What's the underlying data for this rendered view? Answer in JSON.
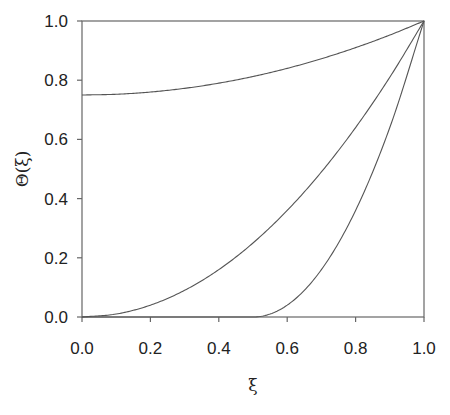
{
  "chart_data": {
    "type": "line",
    "title": "",
    "xlabel": "ξ",
    "ylabel": "Θ(ξ)",
    "xlim": [
      0.0,
      1.0
    ],
    "ylim": [
      0.0,
      1.0
    ],
    "grid": false,
    "legend": null,
    "x_ticks": [
      "0.0",
      "0.2",
      "0.4",
      "0.6",
      "0.8",
      "1.0"
    ],
    "y_ticks": [
      "0.0",
      "0.2",
      "0.4",
      "0.6",
      "0.8",
      "1.0"
    ],
    "x": [
      0.0,
      0.1,
      0.2,
      0.3,
      0.4,
      0.5,
      0.6,
      0.7,
      0.8,
      0.9,
      1.0
    ],
    "series": [
      {
        "name": "curve-1",
        "values": [
          0.75,
          0.7525,
          0.76,
          0.7725,
          0.79,
          0.8125,
          0.84,
          0.8725,
          0.91,
          0.9525,
          1.0
        ]
      },
      {
        "name": "curve-2",
        "values": [
          0.0,
          0.01,
          0.04,
          0.09,
          0.16,
          0.25,
          0.36,
          0.49,
          0.64,
          0.81,
          1.0
        ]
      },
      {
        "name": "curve-3",
        "values": [
          0.0,
          0.0,
          0.0,
          0.0,
          0.0,
          0.0,
          0.04,
          0.16,
          0.36,
          0.64,
          1.0
        ]
      }
    ],
    "line_color": "#555555"
  }
}
